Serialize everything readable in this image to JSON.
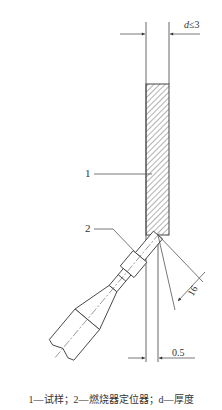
{
  "figure": {
    "labels": {
      "specimen_label": "1",
      "burner_label": "2"
    },
    "dimensions": {
      "thickness_symbol": "d",
      "thickness_relation": "≤3",
      "burner_distance": "16",
      "offset": "0.5"
    },
    "caption": "1—试样；2—燃烧器定位器；d—厚度",
    "colors": {
      "line": "#555555",
      "hatch": "#666666"
    }
  }
}
